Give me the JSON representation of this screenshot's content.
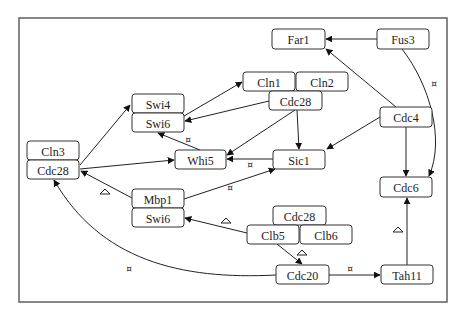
{
  "diagram": {
    "title": "",
    "nodes": [
      {
        "id": "far1",
        "label": "Far1",
        "x": 272,
        "y": 29,
        "w": 53,
        "h": 20
      },
      {
        "id": "fus3",
        "label": "Fus3",
        "x": 377,
        "y": 29,
        "w": 52,
        "h": 20
      },
      {
        "id": "cln1",
        "label": "Cln1",
        "x": 243,
        "y": 72,
        "w": 52,
        "h": 19
      },
      {
        "id": "cln2",
        "label": "Cln2",
        "x": 296,
        "y": 72,
        "w": 52,
        "h": 19
      },
      {
        "id": "cdc28_top",
        "label": "Cdc28",
        "x": 269,
        "y": 91,
        "w": 53,
        "h": 19
      },
      {
        "id": "swi4",
        "label": "Swi4",
        "x": 132,
        "y": 94,
        "w": 52,
        "h": 19
      },
      {
        "id": "swi6_top",
        "label": "Swi6",
        "x": 132,
        "y": 113,
        "w": 52,
        "h": 19
      },
      {
        "id": "cdc4",
        "label": "Cdc4",
        "x": 380,
        "y": 107,
        "w": 52,
        "h": 20
      },
      {
        "id": "whi5",
        "label": "Whi5",
        "x": 175,
        "y": 150,
        "w": 51,
        "h": 19
      },
      {
        "id": "sic1",
        "label": "Sic1",
        "x": 273,
        "y": 150,
        "w": 52,
        "h": 19
      },
      {
        "id": "cln3",
        "label": "Cln3",
        "x": 27,
        "y": 141,
        "w": 52,
        "h": 19
      },
      {
        "id": "cdc28_left",
        "label": "Cdc28",
        "x": 27,
        "y": 160,
        "w": 52,
        "h": 19
      },
      {
        "id": "mbp1",
        "label": "Mbp1",
        "x": 132,
        "y": 189,
        "w": 52,
        "h": 19
      },
      {
        "id": "swi6_bot",
        "label": "Swi6",
        "x": 132,
        "y": 208,
        "w": 52,
        "h": 19
      },
      {
        "id": "cdc6",
        "label": "Cdc6",
        "x": 380,
        "y": 177,
        "w": 52,
        "h": 20
      },
      {
        "id": "cdc28_bot",
        "label": "Cdc28",
        "x": 273,
        "y": 206,
        "w": 53,
        "h": 19
      },
      {
        "id": "clb5",
        "label": "Clb5",
        "x": 247,
        "y": 225,
        "w": 52,
        "h": 19
      },
      {
        "id": "clb6",
        "label": "Clb6",
        "x": 300,
        "y": 225,
        "w": 52,
        "h": 19
      },
      {
        "id": "cdc20",
        "label": "Cdc20",
        "x": 276,
        "y": 265,
        "w": 53,
        "h": 19
      },
      {
        "id": "tah11",
        "label": "Tah11",
        "x": 381,
        "y": 265,
        "w": 52,
        "h": 19
      }
    ],
    "edges": [
      {
        "from": "fus3",
        "to": "far1",
        "type": "activation"
      },
      {
        "from": "cdc4",
        "to": "far1",
        "type": "activation"
      },
      {
        "from": "fus3",
        "to": "cdc6",
        "type": "inhibition-marked",
        "mark": "x"
      },
      {
        "from": "cdc4",
        "to": "sic1",
        "type": "activation"
      },
      {
        "from": "cdc4",
        "to": "cdc6",
        "type": "activation"
      },
      {
        "from": "cdc28_top",
        "to": "swi6_top",
        "type": "activation"
      },
      {
        "from": "swi6_top",
        "to": "cln1",
        "type": "activation"
      },
      {
        "from": "cdc28_top",
        "to": "whi5",
        "type": "activation"
      },
      {
        "from": "cdc28_top",
        "to": "sic1",
        "type": "activation"
      },
      {
        "from": "whi5",
        "to": "swi6_top",
        "type": "inhibition-marked",
        "mark": "x"
      },
      {
        "from": "sic1",
        "to": "whi5",
        "type": "inhibition-marked",
        "mark": "x"
      },
      {
        "from": "cdc28_left",
        "to": "swi4",
        "type": "activation"
      },
      {
        "from": "cdc28_left",
        "to": "whi5",
        "type": "activation"
      },
      {
        "from": "mbp1",
        "to": "cdc28_left",
        "type": "marked",
        "mark": "triangle"
      },
      {
        "from": "mbp1",
        "to": "sic1",
        "type": "inhibition-marked",
        "mark": "x"
      },
      {
        "from": "clb5",
        "to": "swi6_bot",
        "type": "marked",
        "mark": "triangle"
      },
      {
        "from": "clb5",
        "to": "cdc20",
        "type": "marked",
        "mark": "triangle"
      },
      {
        "from": "cdc20",
        "to": "cdc28_left",
        "type": "inhibition-marked",
        "mark": "x"
      },
      {
        "from": "cdc20",
        "to": "tah11",
        "type": "inhibition-marked",
        "mark": "x"
      },
      {
        "from": "tah11",
        "to": "cdc6",
        "type": "marked",
        "mark": "triangle"
      }
    ],
    "marks": [
      {
        "type": "x",
        "x": 434,
        "y": 84
      },
      {
        "type": "x",
        "x": 188,
        "y": 140
      },
      {
        "type": "x",
        "x": 250,
        "y": 165
      },
      {
        "type": "x",
        "x": 230,
        "y": 188
      },
      {
        "type": "x",
        "x": 129,
        "y": 269
      },
      {
        "type": "x",
        "x": 350,
        "y": 269
      },
      {
        "type": "triangle",
        "x": 105,
        "y": 191
      },
      {
        "type": "triangle",
        "x": 226,
        "y": 220
      },
      {
        "type": "triangle",
        "x": 302,
        "y": 252
      },
      {
        "type": "triangle",
        "x": 398,
        "y": 229
      }
    ]
  }
}
